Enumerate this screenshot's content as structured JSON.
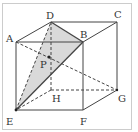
{
  "figure": {
    "type": "cube-perspective",
    "frame_color": "#cccccc",
    "line_color": "#444444",
    "shade_color": "#d9d9d9",
    "vertices": {
      "A": {
        "label": "A",
        "x": 16,
        "y": 42
      },
      "B": {
        "label": "B",
        "x": 83,
        "y": 42
      },
      "C": {
        "label": "C",
        "x": 117,
        "y": 22
      },
      "D": {
        "label": "D",
        "x": 51,
        "y": 22
      },
      "E": {
        "label": "E",
        "x": 16,
        "y": 110
      },
      "F": {
        "label": "F",
        "x": 83,
        "y": 110
      },
      "G": {
        "label": "G",
        "x": 117,
        "y": 90
      },
      "H": {
        "label": "H",
        "x": 51,
        "y": 90
      },
      "P": {
        "label": "P",
        "x": 49,
        "y": 57
      }
    },
    "shaded_face": "DBE",
    "solid_edges": [
      "AB",
      "BF",
      "FE",
      "EA",
      "AD",
      "DC",
      "CB",
      "CG",
      "GF",
      "DB",
      "EB"
    ],
    "dashed_edges": [
      "DH",
      "HE",
      "HG",
      "ED",
      "AG"
    ]
  }
}
